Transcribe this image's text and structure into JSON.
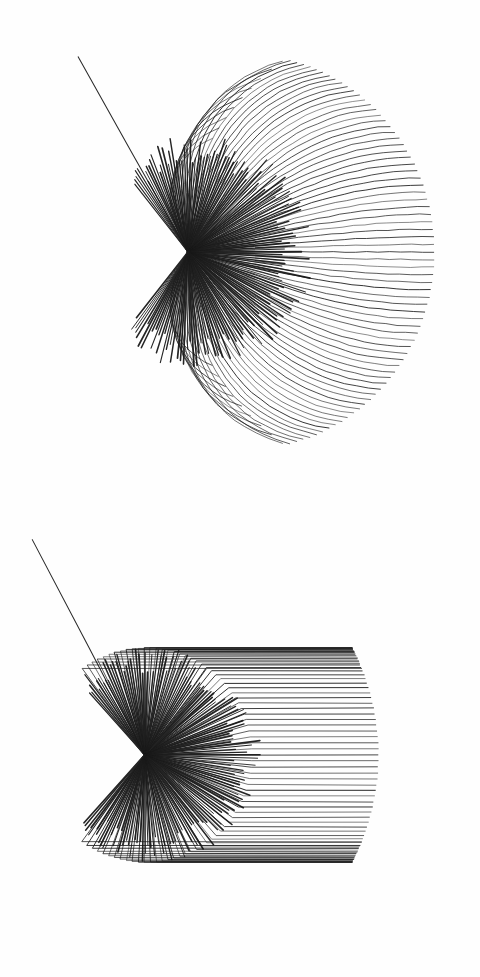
{
  "document": {
    "title": "Ray fan diagrams",
    "background_color": "#fefefe",
    "ink_color": "#1a1a1a",
    "width": 480,
    "height": 977,
    "panel_count": 2
  },
  "chart_data": [
    {
      "type": "line",
      "id": "upper-ray-fan",
      "title": "",
      "subtitle": "",
      "xlabel": "",
      "ylabel": "",
      "description": "Upper panel: a single incident ray arrives from the upper left, strikes a focal vertex, and scatters into a dense fan of smoothly curved outgoing rays that terminate on a circular arc. A notch (re-entrant cusp) appears at the upper and lower extremes of the fan.",
      "grid": false,
      "legend_position": "none",
      "panel_origin": [
        0,
        0
      ],
      "panel_size": [
        480,
        500
      ],
      "vertex": [
        188,
        252
      ],
      "incident_ray": {
        "start": [
          78,
          57
        ],
        "end": [
          188,
          252
        ],
        "width": 1.05
      },
      "fan": {
        "ray_count": 88,
        "angle_start_deg": -118,
        "angle_end_deg": 118,
        "radius": 246,
        "curvature": 0.34,
        "curve_style": "smooth-bowed",
        "stroke_min": 0.55,
        "stroke_max": 0.95
      },
      "notch": {
        "present": true,
        "upper_angle_deg": -96,
        "lower_angle_deg": 96,
        "inset_fraction": 0.42
      },
      "dense_wedge": {
        "angle_start_deg": -128,
        "angle_end_deg": 128,
        "ray_count": 150,
        "radius": 112,
        "opacity": 0.95
      },
      "xlim": [
        0,
        480
      ],
      "ylim": [
        0,
        500
      ]
    },
    {
      "type": "line",
      "id": "lower-ray-fan",
      "title": "",
      "subtitle": "",
      "xlabel": "",
      "ylabel": "",
      "description": "Lower panel: the same incident ray geometry, but each outgoing ray travels straight from the vertex, then kinks sharply at an intermediate radius and continues horizontally to the right, ending on a circular arc. The resulting envelope is a rounded polygon with straight upper-left and lower-left flanks.",
      "grid": false,
      "legend_position": "none",
      "panel_origin": [
        0,
        500
      ],
      "panel_size": [
        480,
        477
      ],
      "vertex": [
        145,
        255
      ],
      "incident_ray": {
        "start": [
          32,
          40
        ],
        "end": [
          145,
          255
        ],
        "width": 1.05
      },
      "fan": {
        "ray_count": 78,
        "angle_start_deg": -126,
        "angle_end_deg": 126,
        "radius": 233,
        "curve_style": "kinked-to-horizontal",
        "kink_fraction": 0.46,
        "stroke_min": 0.6,
        "stroke_max": 1.0
      },
      "notch": {
        "present": false
      },
      "dense_wedge": {
        "angle_start_deg": -132,
        "angle_end_deg": 132,
        "ray_count": 150,
        "radius": 104,
        "opacity": 0.95
      },
      "xlim": [
        0,
        480
      ],
      "ylim": [
        0,
        477
      ]
    }
  ],
  "panels": [
    {
      "name": "upper-panel",
      "label": ""
    },
    {
      "name": "lower-panel",
      "label": ""
    }
  ]
}
